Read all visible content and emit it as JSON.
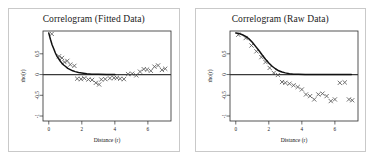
{
  "figure": {
    "panel_count": 2,
    "background_color": "#ffffff",
    "border_color": "#c9c9c9"
  },
  "chart_data": [
    {
      "type": "scatter",
      "panel_index": 0,
      "title": "Correlogram (Fitted Data)",
      "xlabel": "Distance (r)",
      "ylabel": "rho(r)",
      "xlim": [
        -0.35,
        7.4
      ],
      "ylim": [
        -1.12,
        1.05
      ],
      "xticks": [
        0,
        2,
        4,
        6
      ],
      "xticklabels": [
        "0",
        "2",
        "4",
        "6"
      ],
      "yticks": [
        0.5,
        0,
        -0.5,
        -1
      ],
      "yticklabels": [
        "0.5",
        "0",
        "-0.5",
        "-1"
      ],
      "grid": false,
      "legend": "none",
      "zero_reference_line": 0,
      "series": [
        {
          "name": "empirical correlogram",
          "marker": "x",
          "color": "#5a5a5a",
          "x": [
            0.18,
            0.62,
            0.8,
            0.95,
            1.12,
            1.3,
            1.55,
            1.72,
            1.95,
            2.15,
            2.4,
            2.62,
            2.85,
            3.05,
            3.18,
            3.42,
            3.7,
            3.95,
            4.12,
            4.32,
            4.55,
            4.8,
            5.05,
            5.3,
            5.52,
            5.75,
            5.95,
            6.18,
            6.4,
            6.62,
            6.85,
            7.05
          ],
          "y": [
            0.98,
            0.44,
            0.4,
            0.3,
            0.33,
            0.24,
            0.21,
            -0.1,
            -0.11,
            -0.09,
            -0.12,
            -0.13,
            -0.2,
            -0.24,
            -0.12,
            -0.11,
            -0.09,
            -0.08,
            -0.08,
            -0.1,
            -0.11,
            0.01,
            0.02,
            -0.02,
            0.07,
            0.13,
            0.12,
            0.09,
            0.19,
            0.22,
            0.11,
            0.14
          ]
        },
        {
          "name": "fitted exponential model",
          "marker": "line",
          "color": "#111111",
          "model": "exponential",
          "nugget": 0.0,
          "sill": 1.0,
          "range": 0.62,
          "x": [
            0.0,
            0.1,
            0.2,
            0.3,
            0.4,
            0.5,
            0.6,
            0.7,
            0.8,
            0.9,
            1.0,
            1.15,
            1.3,
            1.45,
            1.6,
            1.8,
            2.0,
            2.3,
            2.6,
            3.0,
            3.5,
            4.0
          ],
          "y": [
            1.0,
            0.85,
            0.72,
            0.62,
            0.52,
            0.44,
            0.38,
            0.32,
            0.27,
            0.23,
            0.2,
            0.15,
            0.12,
            0.09,
            0.07,
            0.05,
            0.04,
            0.02,
            0.01,
            0.01,
            0.0,
            0.0
          ]
        }
      ]
    },
    {
      "type": "scatter",
      "panel_index": 1,
      "title": "Correlogram (Raw Data)",
      "xlabel": "Distance (r)",
      "ylabel": "rho(r)",
      "xlim": [
        -0.35,
        7.4
      ],
      "ylim": [
        -1.12,
        1.05
      ],
      "xticks": [
        0,
        2,
        4,
        6
      ],
      "xticklabels": [
        "0",
        "2",
        "4",
        "6"
      ],
      "yticks": [
        0.5,
        0,
        -0.5,
        -1
      ],
      "yticklabels": [
        "0.5",
        "0",
        "-0.5",
        "-1"
      ],
      "grid": false,
      "legend": "none",
      "zero_reference_line": 0,
      "series": [
        {
          "name": "empirical correlogram",
          "marker": "x",
          "color": "#5a5a5a",
          "x": [
            0.15,
            0.6,
            0.95,
            1.25,
            1.55,
            1.8,
            2.05,
            2.3,
            2.55,
            2.8,
            3.0,
            3.25,
            3.5,
            3.75,
            4.0,
            4.25,
            4.5,
            4.75,
            5.0,
            5.25,
            5.5,
            5.75,
            6.0,
            6.3,
            6.6,
            6.85,
            7.05
          ],
          "y": [
            0.96,
            0.88,
            0.7,
            0.56,
            0.42,
            0.3,
            0.16,
            0.04,
            -0.01,
            -0.18,
            -0.2,
            -0.22,
            -0.26,
            -0.3,
            -0.36,
            -0.48,
            -0.52,
            -0.6,
            -0.48,
            -0.46,
            -0.52,
            -0.64,
            -0.6,
            -0.2,
            -0.19,
            -0.6,
            -0.62
          ]
        },
        {
          "name": "fitted model",
          "marker": "line",
          "color": "#111111",
          "model": "gaussian",
          "nugget": 0.0,
          "sill": 1.0,
          "range": 2.6,
          "x": [
            0.0,
            0.2,
            0.4,
            0.6,
            0.8,
            1.0,
            1.2,
            1.4,
            1.6,
            1.8,
            2.0,
            2.2,
            2.4,
            2.6,
            2.8,
            3.0,
            3.25,
            3.5,
            3.8,
            4.2,
            4.6,
            5.0,
            5.6,
            6.2,
            7.0
          ],
          "y": [
            1.0,
            0.99,
            0.96,
            0.92,
            0.86,
            0.78,
            0.68,
            0.58,
            0.47,
            0.37,
            0.28,
            0.2,
            0.14,
            0.09,
            0.06,
            0.04,
            0.02,
            0.01,
            0.01,
            0.0,
            0.0,
            0.0,
            0.0,
            0.0,
            0.0
          ]
        }
      ]
    }
  ]
}
